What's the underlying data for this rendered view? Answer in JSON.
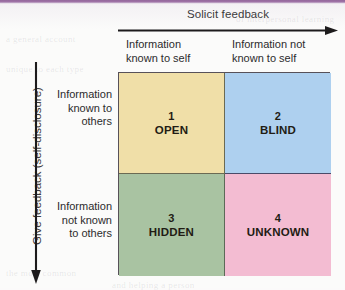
{
  "figure": {
    "background_color": "#fbfbfa",
    "top_band_color": "#8e5f96"
  },
  "axes": {
    "horizontal": {
      "label": "Solicit feedback",
      "direction": "right",
      "arrow_icon": "arrow-right-icon"
    },
    "vertical": {
      "label": "Give feedback (self-disclosure)",
      "direction": "down",
      "arrow_icon": "arrow-down-icon"
    }
  },
  "column_headers": [
    {
      "line1": "Information",
      "line2": "known to self"
    },
    {
      "line1": "Information not",
      "line2": "known to self"
    }
  ],
  "row_headers": [
    {
      "line1": "Information",
      "line2": "known to",
      "line3": "others"
    },
    {
      "line1": "Information",
      "line2": "not known",
      "line3": "to others"
    }
  ],
  "quadrants": [
    {
      "number": "1",
      "name": "OPEN",
      "color": "#f0dfa8"
    },
    {
      "number": "2",
      "name": "BLIND",
      "color": "#aed0ef"
    },
    {
      "number": "3",
      "name": "HIDDEN",
      "color": "#a9c3a2"
    },
    {
      "number": "4",
      "name": "UNKNOWN",
      "color": "#f3bcd2"
    }
  ],
  "background_text": {
    "line_a": "a general account",
    "line_b": "unique to each type",
    "line_c": "the most common",
    "line_d": "and helping a person",
    "line_e": "of interpersonal learning"
  }
}
